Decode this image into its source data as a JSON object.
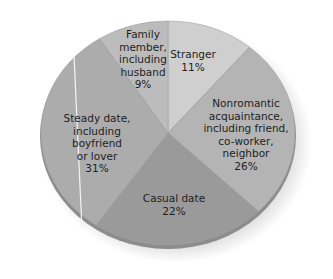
{
  "chart_data": {
    "type": "pie",
    "title": "",
    "slices": [
      {
        "label": "Stranger",
        "value": 11,
        "color": "#cfcfcf"
      },
      {
        "label": "Nonromantic acquaintance, including friend, co-worker, neighbor",
        "value": 26,
        "color": "#b4b4b4"
      },
      {
        "label": "Casual date",
        "value": 22,
        "color": "#9a9a9a"
      },
      {
        "label": "Steady date, including boyfriend or lover",
        "value": 31,
        "color": "#acacac"
      },
      {
        "label": "Family member, including husband",
        "value": 9,
        "color": "#bcbcbc"
      }
    ],
    "legend": "none (labels inside slices)",
    "start_angle": "12 o'clock, clockwise"
  },
  "labels": {
    "stranger": "Stranger\n11%",
    "nonromantic": "Nonromantic\nacquaintance,\nincluding friend,\nco-worker,\nneighbor\n26%",
    "casual": "Casual date\n22%",
    "steady": "Steady date,\nincluding\nboyfriend\nor lover\n31%",
    "family": "Family\nmember,\nincluding\nhusband\n9%"
  }
}
